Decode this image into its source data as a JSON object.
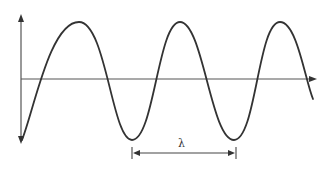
{
  "diagram": {
    "title": "",
    "wavelength_label": "λ",
    "colors": {
      "background": "#ffffff",
      "wave": "#333333",
      "axis": "#555555"
    },
    "axes": {
      "vertical": {
        "x": 21,
        "y_top": 15,
        "y_bottom": 143,
        "arrows": [
          "up",
          "down"
        ]
      },
      "horizontal": {
        "y": 79,
        "x_start": 21,
        "x_end": 316,
        "arrows": [
          "right"
        ]
      }
    },
    "wave": {
      "peaks_x": [
        79,
        180,
        280
      ],
      "troughs_x": [
        132,
        234
      ],
      "crest_y": 22,
      "trough_y": 140
    },
    "wavelength_marker": {
      "x_start": 132,
      "x_end": 236,
      "y": 153
    }
  }
}
